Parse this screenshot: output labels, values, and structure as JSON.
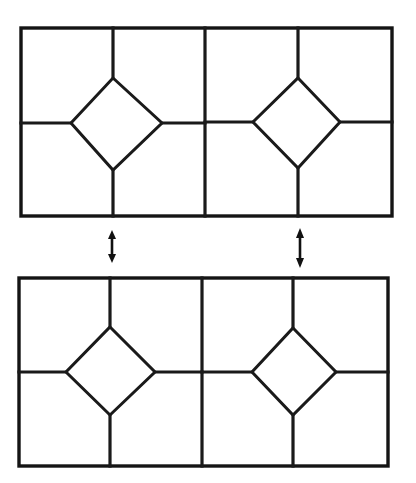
{
  "figure": {
    "background_color": "#ffffff",
    "line_color": "#1a1a1a",
    "line_width_px": 3.2,
    "width_px": 416,
    "height_px": 483,
    "panel_count": 2,
    "arrow_count": 2
  },
  "panels": [
    {
      "id": "top-panel",
      "label": "Top tiling pattern",
      "outer_rect": {
        "x": 21,
        "y": 28,
        "width": 371,
        "height": 188
      },
      "center_divider_x": 205,
      "cells": [
        {
          "id": "top-left-cell",
          "label": "Top left square cell",
          "rect": {
            "x": 21,
            "y": 28,
            "width": 184,
            "height": 188
          },
          "diamond": {
            "top": {
              "x": 113,
              "y": 78
            },
            "right": {
              "x": 162,
              "y": 123
            },
            "bottom": {
              "x": 113,
              "y": 170
            },
            "left": {
              "x": 71,
              "y": 123
            }
          },
          "spokes": {
            "up": {
              "from": {
                "x": 113,
                "y": 78
              },
              "to": {
                "x": 113,
                "y": 28
              }
            },
            "down": {
              "from": {
                "x": 113,
                "y": 170
              },
              "to": {
                "x": 113,
                "y": 216
              }
            },
            "left": {
              "from": {
                "x": 71,
                "y": 123
              },
              "to": {
                "x": 21,
                "y": 123
              }
            },
            "right": {
              "from": {
                "x": 162,
                "y": 123
              },
              "to": {
                "x": 205,
                "y": 123
              }
            }
          }
        },
        {
          "id": "top-right-cell",
          "label": "Top right square cell",
          "rect": {
            "x": 205,
            "y": 28,
            "width": 187,
            "height": 188
          },
          "diamond": {
            "top": {
              "x": 298,
              "y": 78
            },
            "right": {
              "x": 340,
              "y": 122
            },
            "bottom": {
              "x": 298,
              "y": 168
            },
            "left": {
              "x": 253,
              "y": 122
            }
          },
          "spokes": {
            "up": {
              "from": {
                "x": 298,
                "y": 78
              },
              "to": {
                "x": 298,
                "y": 28
              }
            },
            "down": {
              "from": {
                "x": 298,
                "y": 168
              },
              "to": {
                "x": 298,
                "y": 216
              }
            },
            "left": {
              "from": {
                "x": 253,
                "y": 122
              },
              "to": {
                "x": 205,
                "y": 122
              }
            },
            "right": {
              "from": {
                "x": 340,
                "y": 122
              },
              "to": {
                "x": 392,
                "y": 122
              }
            }
          }
        }
      ]
    },
    {
      "id": "bottom-panel",
      "label": "Bottom tiling pattern",
      "outer_rect": {
        "x": 19,
        "y": 278,
        "width": 369,
        "height": 188
      },
      "center_divider_x": 202,
      "cells": [
        {
          "id": "bottom-left-cell",
          "label": "Bottom left square cell",
          "rect": {
            "x": 19,
            "y": 278,
            "width": 183,
            "height": 188
          },
          "diamond": {
            "top": {
              "x": 110,
              "y": 327
            },
            "right": {
              "x": 155,
              "y": 372
            },
            "bottom": {
              "x": 110,
              "y": 415
            },
            "left": {
              "x": 66,
              "y": 372
            }
          },
          "spokes": {
            "up": {
              "from": {
                "x": 110,
                "y": 327
              },
              "to": {
                "x": 110,
                "y": 278
              }
            },
            "down": {
              "from": {
                "x": 110,
                "y": 415
              },
              "to": {
                "x": 110,
                "y": 466
              }
            },
            "left": {
              "from": {
                "x": 66,
                "y": 372
              },
              "to": {
                "x": 19,
                "y": 372
              }
            },
            "right": {
              "from": {
                "x": 155,
                "y": 372
              },
              "to": {
                "x": 202,
                "y": 372
              }
            }
          }
        },
        {
          "id": "bottom-right-cell",
          "label": "Bottom right square cell",
          "rect": {
            "x": 202,
            "y": 278,
            "width": 186,
            "height": 188
          },
          "diamond": {
            "top": {
              "x": 293,
              "y": 328
            },
            "right": {
              "x": 336,
              "y": 372
            },
            "bottom": {
              "x": 293,
              "y": 415
            },
            "left": {
              "x": 252,
              "y": 372
            }
          },
          "spokes": {
            "up": {
              "from": {
                "x": 293,
                "y": 328
              },
              "to": {
                "x": 293,
                "y": 278
              }
            },
            "down": {
              "from": {
                "x": 293,
                "y": 415
              },
              "to": {
                "x": 293,
                "y": 466
              }
            },
            "left": {
              "from": {
                "x": 252,
                "y": 372
              },
              "to": {
                "x": 202,
                "y": 372
              }
            },
            "right": {
              "from": {
                "x": 336,
                "y": 372
              },
              "to": {
                "x": 388,
                "y": 372
              }
            }
          }
        }
      ]
    }
  ],
  "arrows": [
    {
      "id": "left-arrow",
      "label": "Left double headed vertical arrow",
      "type": "double-headed-vertical",
      "x": 112,
      "y_top": 230,
      "y_bottom": 263,
      "head_width": 8,
      "head_length": 9
    },
    {
      "id": "right-arrow",
      "label": "Right double headed vertical arrow",
      "type": "double-headed-vertical",
      "x": 300,
      "y_top": 228,
      "y_bottom": 268,
      "head_width": 8,
      "head_length": 10
    }
  ]
}
